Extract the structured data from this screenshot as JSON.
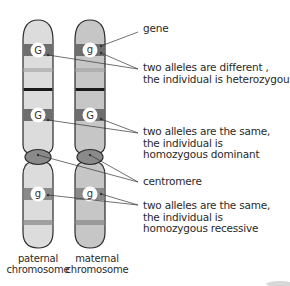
{
  "diagram": {
    "type": "homologous chromosome pair with alleles",
    "chromosomes": [
      {
        "name": "paternal",
        "label_line1": "paternal",
        "label_line2": "chromosome",
        "color": "#dcdcdc",
        "alleles": [
          "G",
          "G",
          "g"
        ]
      },
      {
        "name": "maternal",
        "label_line1": "maternal",
        "label_line2": "chromosome",
        "color": "#c6c6c6",
        "alleles": [
          "g",
          "G",
          "g"
        ]
      }
    ],
    "labels": {
      "gene": "gene",
      "heterozygous": {
        "line1": "two alleles are different ,",
        "line2": "the individual is heterozygous"
      },
      "homozygous_dominant": {
        "line1": "two alleles are the same,",
        "line2": "the individual is",
        "line3": "homozygous dominant"
      },
      "centromere": "centromere",
      "homozygous_recessive": {
        "line1": "two alleles are the same,",
        "line2": "the individual is",
        "line3": "homozygous recessive"
      }
    },
    "colors": {
      "band_dark": "#6e6e6e",
      "band_light": "#a8a8a8",
      "centromere": "#8a8a8a",
      "outline": "#2b2b2b",
      "allele_circle": "#ffffff"
    }
  }
}
